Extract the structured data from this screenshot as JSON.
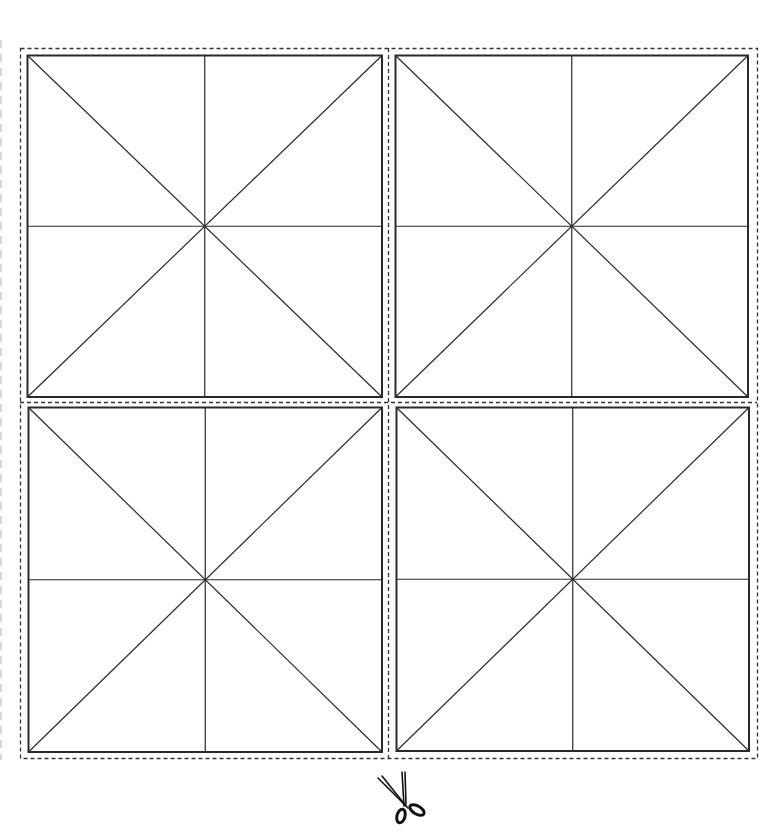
{
  "sheet": {
    "title": "",
    "grid": {
      "rows": 2,
      "cols": 2
    },
    "cell_style": "mi-zi-ge (square with diagonals and center cross)",
    "panels": [
      {
        "id": "top-left"
      },
      {
        "id": "top-right"
      },
      {
        "id": "bottom-left"
      },
      {
        "id": "bottom-right"
      }
    ],
    "cut_guide": {
      "style": "dashed",
      "icon": "scissors-icon"
    },
    "colors": {
      "line": "#2a2a2a",
      "dashed": "#333333",
      "background": "#ffffff"
    }
  }
}
